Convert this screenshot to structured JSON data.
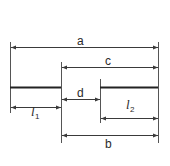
{
  "diagram": {
    "title": "",
    "colors": {
      "line": "#3a3a3a",
      "text": "#2a2a2a",
      "background": "#ffffff"
    },
    "labels": {
      "a": "a",
      "c": "c",
      "d": "d",
      "b": "b",
      "l1_main": "l",
      "l1_sub": "1",
      "l2_main": "l",
      "l2_sub": "2"
    },
    "dimensions": [
      {
        "name": "a",
        "from": "left-extension",
        "to": "right-extension"
      },
      {
        "name": "c",
        "from": "inner-left-extension",
        "to": "right-extension"
      },
      {
        "name": "d",
        "from": "inner-left-extension",
        "to": "inner-right-extension"
      },
      {
        "name": "l1",
        "from": "left-extension",
        "to": "inner-left-extension"
      },
      {
        "name": "l2",
        "from": "inner-right-extension",
        "to": "right-extension"
      },
      {
        "name": "b",
        "from": "inner-left-extension",
        "to": "right-extension"
      }
    ]
  }
}
